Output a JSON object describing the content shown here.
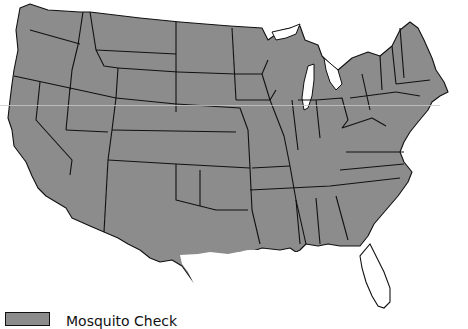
{
  "map": {
    "title": "Contiguous United States",
    "region": "US lower 48 states",
    "fill_color": "#8c8c8c",
    "border_color": "#111111",
    "background_color": "#ffffff",
    "unshaded_areas": [
      "South Texas coast",
      "Southern Louisiana coast",
      "Central and South Florida"
    ]
  },
  "legend": {
    "items": [
      {
        "label": "Mosquito Check",
        "color": "#8c8c8c"
      }
    ]
  }
}
